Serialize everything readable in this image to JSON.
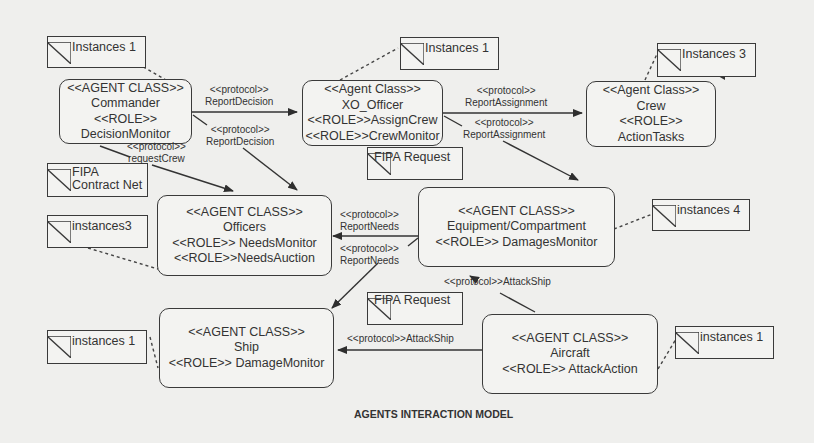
{
  "diagram": {
    "title": "AGENTS INTERACTION MODEL",
    "agents": [
      {
        "id": "commander",
        "lines": [
          "<<AGENT CLASS>>",
          "Commander",
          "<<ROLE>>",
          "DecisionMonitor"
        ]
      },
      {
        "id": "xo_officer",
        "lines": [
          "<<Agent Class>>",
          "XO_Officer",
          "<<ROLE>>AssignCrew",
          "<<ROLE>>CrewMonitor"
        ]
      },
      {
        "id": "crew",
        "lines": [
          "<<Agent Class>>",
          "Crew",
          "<<ROLE>>",
          "ActionTasks"
        ]
      },
      {
        "id": "officers",
        "lines": [
          "<<AGENT CLASS>>",
          "Officers",
          "<<ROLE>> NeedsMonitor",
          "<<ROLE>>NeedsAuction"
        ]
      },
      {
        "id": "equipment",
        "lines": [
          "<<AGENT CLASS>>",
          "Equipment/Compartment",
          "<<ROLE>> DamagesMonitor"
        ]
      },
      {
        "id": "ship",
        "lines": [
          "<<AGENT CLASS>>",
          "Ship",
          "<<ROLE>> DamageMonitor"
        ]
      },
      {
        "id": "aircraft",
        "lines": [
          "<<AGENT CLASS>>",
          "Aircraft",
          "<<ROLE>> AttackAction"
        ]
      }
    ],
    "notes": [
      {
        "id": "commander_instances",
        "text": "Instances 1"
      },
      {
        "id": "xo_instances",
        "text": "Instances 1"
      },
      {
        "id": "crew_instances",
        "text": "Instances 3"
      },
      {
        "id": "fipa_contract_net",
        "text": "FIPA Contract Net"
      },
      {
        "id": "officers_instances",
        "text": "instances3"
      },
      {
        "id": "fipa_request_top",
        "text": "FIPA Request"
      },
      {
        "id": "equipment_instances",
        "text": "instances 4"
      },
      {
        "id": "fipa_request_bottom",
        "text": "FIPA Request"
      },
      {
        "id": "ship_instances",
        "text": "instances 1"
      },
      {
        "id": "aircraft_instances",
        "text": "instances 1"
      }
    ],
    "protocols": [
      {
        "from": "commander",
        "to": "xo_officer",
        "stereotype": "<<protocol>>",
        "name": "ReportDecision"
      },
      {
        "from": "commander",
        "to": "officers",
        "stereotype": "<<protocol>>",
        "name": "ReportDecision"
      },
      {
        "from": "commander",
        "to": "officers",
        "stereotype": "<<protocol>>",
        "name": "requestCrew"
      },
      {
        "from": "xo_officer",
        "to": "crew",
        "stereotype": "<<protocol>>",
        "name": "ReportAssignment"
      },
      {
        "from": "xo_officer",
        "to": "equipment",
        "stereotype": "<<protocol>>",
        "name": "ReportAssignment"
      },
      {
        "from": "equipment",
        "to": "officers",
        "stereotype": "<<protocol>>",
        "name": "ReportNeeds"
      },
      {
        "from": "equipment",
        "to": "ship",
        "stereotype": "<<protocol>>",
        "name": "ReportNeeds"
      },
      {
        "from": "aircraft",
        "to": "equipment",
        "stereotype": "<<protocol>>",
        "name": "AttackShip",
        "inline": "<<protocol>>AttackShip"
      },
      {
        "from": "aircraft",
        "to": "ship",
        "stereotype": "<<protocol>>",
        "name": "AttackShip",
        "inline": "<<protocol>>AttackShip"
      }
    ]
  }
}
